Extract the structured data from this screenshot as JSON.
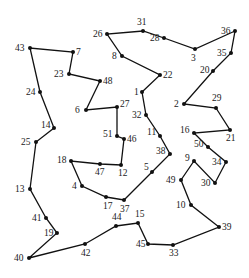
{
  "diagram": {
    "type": "tsp-tour",
    "node_color": "#111111",
    "edge_color": "#111111",
    "nodes": [
      {
        "id": "1",
        "x": 142,
        "y": 92,
        "lx": -8,
        "ly": 3
      },
      {
        "id": "2",
        "x": 184,
        "y": 104,
        "lx": -10,
        "ly": 3
      },
      {
        "id": "3",
        "x": 195,
        "y": 49,
        "lx": -4,
        "ly": 12
      },
      {
        "id": "4",
        "x": 82,
        "y": 186,
        "lx": -10,
        "ly": 3
      },
      {
        "id": "5",
        "x": 152,
        "y": 172,
        "lx": -8,
        "ly": -2
      },
      {
        "id": "6",
        "x": 86,
        "y": 110,
        "lx": -11,
        "ly": 3
      },
      {
        "id": "7",
        "x": 73,
        "y": 52,
        "lx": 3,
        "ly": 3
      },
      {
        "id": "8",
        "x": 122,
        "y": 56,
        "lx": -10,
        "ly": 3
      },
      {
        "id": "9",
        "x": 194,
        "y": 161,
        "lx": -9,
        "ly": 0
      },
      {
        "id": "10",
        "x": 191,
        "y": 205,
        "lx": -15,
        "ly": 3
      },
      {
        "id": "11",
        "x": 160,
        "y": 136,
        "lx": -13,
        "ly": -1
      },
      {
        "id": "12",
        "x": 121,
        "y": 165,
        "lx": -3,
        "ly": 11
      },
      {
        "id": "13",
        "x": 30,
        "y": 189,
        "lx": -15,
        "ly": 3
      },
      {
        "id": "14",
        "x": 54,
        "y": 128,
        "lx": -13,
        "ly": 0
      },
      {
        "id": "15",
        "x": 138,
        "y": 223,
        "lx": -3,
        "ly": -6
      },
      {
        "id": "16",
        "x": 194,
        "y": 133,
        "lx": -14,
        "ly": 0
      },
      {
        "id": "17",
        "x": 106,
        "y": 197,
        "lx": -3,
        "ly": 12
      },
      {
        "id": "18",
        "x": 71,
        "y": 161,
        "lx": -14,
        "ly": 2
      },
      {
        "id": "19",
        "x": 57,
        "y": 233,
        "lx": -13,
        "ly": 3
      },
      {
        "id": "20",
        "x": 213,
        "y": 71,
        "lx": -13,
        "ly": 2
      },
      {
        "id": "21",
        "x": 230,
        "y": 130,
        "lx": -4,
        "ly": 11
      },
      {
        "id": "22",
        "x": 160,
        "y": 75,
        "lx": 3,
        "ly": 3
      },
      {
        "id": "23",
        "x": 69,
        "y": 74,
        "lx": -15,
        "ly": 3
      },
      {
        "id": "24",
        "x": 40,
        "y": 92,
        "lx": -14,
        "ly": 3
      },
      {
        "id": "25",
        "x": 36,
        "y": 142,
        "lx": -15,
        "ly": 3
      },
      {
        "id": "26",
        "x": 107,
        "y": 34,
        "lx": -14,
        "ly": 3
      },
      {
        "id": "27",
        "x": 117,
        "y": 107,
        "lx": 3,
        "ly": 0
      },
      {
        "id": "28",
        "x": 164,
        "y": 38,
        "lx": -14,
        "ly": 3
      },
      {
        "id": "29",
        "x": 216,
        "y": 108,
        "lx": -4,
        "ly": -7
      },
      {
        "id": "30",
        "x": 215,
        "y": 183,
        "lx": -14,
        "ly": 3
      },
      {
        "id": "31",
        "x": 143,
        "y": 31,
        "lx": -6,
        "ly": -6
      },
      {
        "id": "32",
        "x": 146,
        "y": 115,
        "lx": -14,
        "ly": 3
      },
      {
        "id": "33",
        "x": 173,
        "y": 245,
        "lx": -4,
        "ly": 11
      },
      {
        "id": "34",
        "x": 226,
        "y": 162,
        "lx": -14,
        "ly": 3
      },
      {
        "id": "35",
        "x": 231,
        "y": 53,
        "lx": -14,
        "ly": 3
      },
      {
        "id": "36",
        "x": 235,
        "y": 31,
        "lx": -14,
        "ly": 3
      },
      {
        "id": "37",
        "x": 124,
        "y": 200,
        "lx": -4,
        "ly": 12
      },
      {
        "id": "38",
        "x": 170,
        "y": 154,
        "lx": -14,
        "ly": 0
      },
      {
        "id": "39",
        "x": 219,
        "y": 227,
        "lx": 3,
        "ly": 3
      },
      {
        "id": "40",
        "x": 29,
        "y": 258,
        "lx": -15,
        "ly": 3
      },
      {
        "id": "41",
        "x": 46,
        "y": 218,
        "lx": -14,
        "ly": 3
      },
      {
        "id": "42",
        "x": 85,
        "y": 244,
        "lx": -4,
        "ly": 12
      },
      {
        "id": "43",
        "x": 30,
        "y": 48,
        "lx": -15,
        "ly": 3
      },
      {
        "id": "44",
        "x": 116,
        "y": 226,
        "lx": -4,
        "ly": -6
      },
      {
        "id": "45",
        "x": 148,
        "y": 244,
        "lx": -12,
        "ly": 3
      },
      {
        "id": "46",
        "x": 124,
        "y": 139,
        "lx": 3,
        "ly": 3
      },
      {
        "id": "47",
        "x": 100,
        "y": 164,
        "lx": -5,
        "ly": 11
      },
      {
        "id": "48",
        "x": 100,
        "y": 81,
        "lx": 3,
        "ly": 3
      },
      {
        "id": "49",
        "x": 181,
        "y": 180,
        "lx": -15,
        "ly": 3
      },
      {
        "id": "50",
        "x": 208,
        "y": 147,
        "lx": -14,
        "ly": 0
      },
      {
        "id": "51",
        "x": 117,
        "y": 136,
        "lx": -14,
        "ly": 1
      }
    ],
    "tour": [
      "40",
      "42",
      "44",
      "15",
      "45",
      "33",
      "39",
      "10",
      "49",
      "9",
      "30",
      "34",
      "50",
      "16",
      "21",
      "29",
      "2",
      "20",
      "35",
      "36",
      "3",
      "28",
      "31",
      "26",
      "8",
      "22",
      "1",
      "32",
      "11",
      "38",
      "5",
      "37",
      "17",
      "4",
      "18",
      "47",
      "12",
      "46",
      "51",
      "27",
      "6",
      "48",
      "23",
      "7",
      "43",
      "24",
      "14",
      "25",
      "13",
      "41",
      "19",
      "40"
    ]
  }
}
